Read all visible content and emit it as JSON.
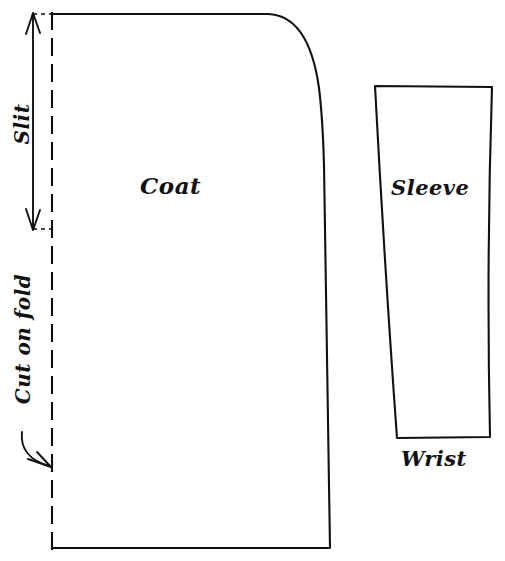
{
  "diagram": {
    "background_color": "#ffffff",
    "ink_color": "#111111",
    "pieces": [
      {
        "name": "coat",
        "label": "Coat",
        "edges": {
          "left": "cut on fold (dashed)",
          "top": "straight then curved shoulder",
          "right": "slightly curved side seam",
          "bottom": "straight hem"
        }
      },
      {
        "name": "sleeve",
        "label": "Sleeve",
        "bottom_label": "Wrist",
        "edges": {
          "left": "curved inner seam, tapering",
          "top": "straight cap",
          "right": "curved outer seam, tapering",
          "bottom": "straight wrist edge"
        }
      }
    ],
    "annotations": [
      {
        "name": "slit",
        "label": "Slit",
        "orientation": "vertical",
        "marker": "double-headed-arrow"
      },
      {
        "name": "cut-on-fold",
        "label": "Cut on fold",
        "orientation": "vertical",
        "marker": "curved-arrow"
      }
    ],
    "labels": {
      "coat": "Coat",
      "sleeve": "Sleeve",
      "wrist": "Wrist",
      "slit": "Slit",
      "cut_on_fold": "Cut on fold"
    }
  }
}
